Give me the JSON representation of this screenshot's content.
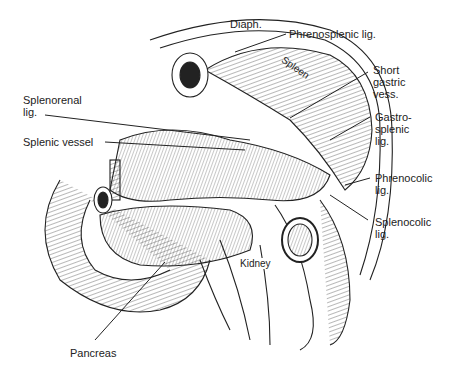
{
  "figure": {
    "type": "anatomical-illustration",
    "labels": {
      "diaph": "Diaph.",
      "phrenosplenic": "Phrenosplenic lig.",
      "short_gastric": "Short\ngastric\nvess.",
      "splenorenal": "Splenorenal\nlig.",
      "splenic_vessel": "Splenic vessel",
      "gastrosplenic": "Gastro-\nsplenic\nlig.",
      "phrenocolic": "Phrenocolic\nlig.",
      "splenocolic": "Splenocolic\nlig.",
      "pancreas": "Pancreas"
    },
    "inline_labels": {
      "spleen": "Spleen",
      "kidney": "Kidney"
    },
    "colors": {
      "ink": "#222222",
      "background": "#ffffff"
    }
  }
}
